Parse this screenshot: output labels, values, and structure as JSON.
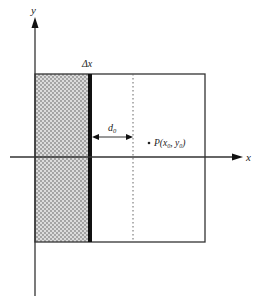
{
  "diagram": {
    "axes": {
      "x_label": "x",
      "y_label": "y"
    },
    "labels": {
      "delta_x": "Δx",
      "d0_main": "d",
      "d0_sub": "0",
      "point_prefix": "P(x",
      "point_x_sub": "0",
      "point_mid": ", y",
      "point_y_sub": "0",
      "point_suffix": ")"
    },
    "colors": {
      "line": "#333333",
      "shade": "#d9d9d9",
      "dots": "#8a8a8a",
      "bar": "#111111"
    }
  }
}
